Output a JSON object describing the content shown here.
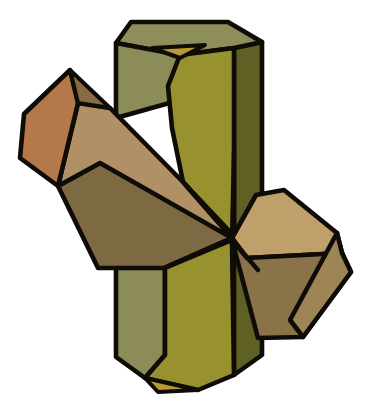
{
  "figure": {
    "title": "Cruciform penetration twin crystal",
    "background_color": "#ffffff",
    "outline_color": "#0f0c07",
    "canvas": {
      "width": 370,
      "height": 420
    }
  },
  "palette": {
    "olive_light": "#8b8c57",
    "olive_front": "#97922f",
    "olive_dark_right": "#5e6024",
    "olive_top": "#8d8e59",
    "olive_tip": "#b79a33",
    "brown_light": "#b5784a",
    "brown_mid": "#a98a5e",
    "brown_tan": "#bfa06a",
    "brown_dark": "#6d5c39",
    "brown_deep": "#8a7348",
    "brown_shadow": "#7d6a43",
    "outline": "#0f0c07"
  },
  "crystals": [
    {
      "id": "vertical-prism",
      "name": "Vertical hexagonal prism",
      "orientation": "vertical",
      "color_family": "olive",
      "faces": [
        {
          "name": "top-termination-face",
          "fill": "#8d8e59"
        },
        {
          "name": "top-tip-facet",
          "fill": "#b79a33"
        },
        {
          "name": "left-prism-face-upper",
          "fill": "#8b8c57"
        },
        {
          "name": "front-prism-face-upper",
          "fill": "#97922f"
        },
        {
          "name": "right-prism-face",
          "fill": "#5e6024"
        },
        {
          "name": "left-prism-face-lower",
          "fill": "#8b8c57"
        },
        {
          "name": "front-prism-face-lower",
          "fill": "#97922f"
        },
        {
          "name": "bottom-tip-facet",
          "fill": "#b79a33"
        }
      ]
    },
    {
      "id": "diagonal-prism",
      "name": "Diagonal hexagonal prism",
      "orientation": "diagonal upper-left to lower-right",
      "color_family": "brown",
      "faces": [
        {
          "name": "left-termination-face",
          "fill": "#b5784a"
        },
        {
          "name": "left-upper-prism-face",
          "fill": "#b09064"
        },
        {
          "name": "left-lower-prism-face",
          "fill": "#7d6a43"
        },
        {
          "name": "left-small-bevel-facet",
          "fill": "#8a6a43"
        },
        {
          "name": "right-upper-prism-face",
          "fill": "#bfa06a"
        },
        {
          "name": "right-lower-prism-face",
          "fill": "#8a7348"
        },
        {
          "name": "right-termination-face",
          "fill": "#9d8556"
        }
      ]
    }
  ],
  "junction": {
    "name": "twin-intersection-point",
    "x": 232,
    "y": 238
  },
  "annotations": {
    "labels": [],
    "caption": ""
  }
}
